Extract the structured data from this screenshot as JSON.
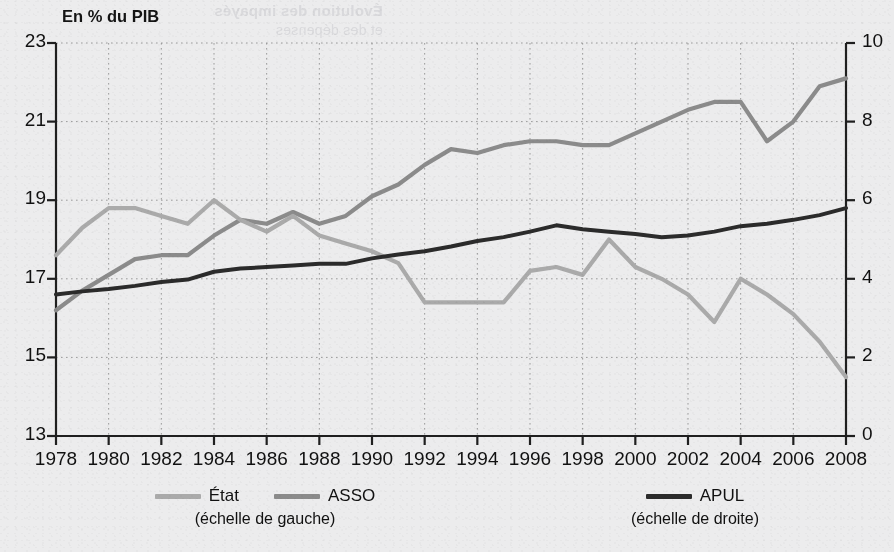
{
  "bleed_text": {
    "line1": "Évolution des impayés",
    "line2": "et des dépenses"
  },
  "chart_data": {
    "type": "line",
    "title": "",
    "axis_note": "En % du PIB",
    "xlabel": "",
    "ylabel": "En % du PIB",
    "x": [
      1978,
      1979,
      1980,
      1981,
      1982,
      1983,
      1984,
      1985,
      1986,
      1987,
      1988,
      1989,
      1990,
      1991,
      1992,
      1993,
      1994,
      1995,
      1996,
      1997,
      1998,
      1999,
      2000,
      2001,
      2002,
      2003,
      2004,
      2005,
      2006,
      2007,
      2008
    ],
    "xtick_labels": [
      "1978",
      "1980",
      "1982",
      "1984",
      "1986",
      "1988",
      "1990",
      "1992",
      "1994",
      "1996",
      "1998",
      "2000",
      "2002",
      "2004",
      "2006",
      "2008"
    ],
    "xticks": [
      1978,
      1980,
      1982,
      1984,
      1986,
      1988,
      1990,
      1992,
      1994,
      1996,
      1998,
      2000,
      2002,
      2004,
      2006,
      2008
    ],
    "xlim": [
      1978,
      2008
    ],
    "left_axis": {
      "label": "En % du PIB",
      "ticks": [
        13,
        15,
        17,
        19,
        21,
        23
      ],
      "tick_labels": [
        "13",
        "15",
        "17",
        "19",
        "21",
        "23"
      ],
      "ylim": [
        13,
        23
      ]
    },
    "right_axis": {
      "ticks": [
        0,
        2,
        4,
        6,
        8,
        10
      ],
      "tick_labels": [
        "0",
        "2",
        "4",
        "6",
        "8",
        "10"
      ],
      "ylim": [
        0,
        10
      ]
    },
    "grid": true,
    "grid_style": "dotted",
    "legend_position": "bottom",
    "series": [
      {
        "name": "ASSO",
        "axis": "left",
        "color": "#8b8b8b",
        "scale_note": "(échelle de gauche)",
        "values": [
          16.2,
          16.7,
          17.1,
          17.5,
          17.6,
          17.6,
          18.1,
          18.5,
          18.4,
          18.7,
          18.4,
          18.6,
          19.1,
          19.4,
          19.9,
          20.3,
          20.2,
          20.4,
          20.5,
          20.5,
          20.4,
          20.4,
          20.7,
          21.0,
          21.3,
          21.5,
          21.5,
          20.5,
          21.0,
          21.9,
          22.1
        ]
      },
      {
        "name": "État",
        "axis": "left",
        "color": "#aaaaaa",
        "scale_note": "(échelle de gauche)",
        "values": [
          17.6,
          18.3,
          18.8,
          18.8,
          18.6,
          18.4,
          19.0,
          18.5,
          18.2,
          18.6,
          18.1,
          17.9,
          17.7,
          17.4,
          16.4,
          16.4,
          16.4,
          16.4,
          17.2,
          17.3,
          17.1,
          18.0,
          17.3,
          17.0,
          16.6,
          15.9,
          17.0,
          16.6,
          16.1,
          15.4,
          14.5
        ]
      },
      {
        "name": "APUL",
        "axis": "right",
        "color": "#2b2b2b",
        "scale_note": "(échelle de droite)",
        "values": [
          3.6,
          3.68,
          3.74,
          3.82,
          3.92,
          3.98,
          4.18,
          4.26,
          4.3,
          4.34,
          4.38,
          4.38,
          4.52,
          4.62,
          4.7,
          4.82,
          4.96,
          5.06,
          5.2,
          5.36,
          5.26,
          5.2,
          5.14,
          5.06,
          5.1,
          5.2,
          5.34,
          5.4,
          5.5,
          5.62,
          5.8
        ]
      }
    ]
  },
  "legend": {
    "left_group": {
      "items": [
        {
          "label": "État",
          "color": "#aaaaaa"
        },
        {
          "label": "ASSO",
          "color": "#8b8b8b"
        }
      ],
      "scale": "(échelle de gauche)"
    },
    "right_group": {
      "items": [
        {
          "label": "APUL",
          "color": "#2b2b2b"
        }
      ],
      "scale": "(échelle de droite)"
    }
  }
}
